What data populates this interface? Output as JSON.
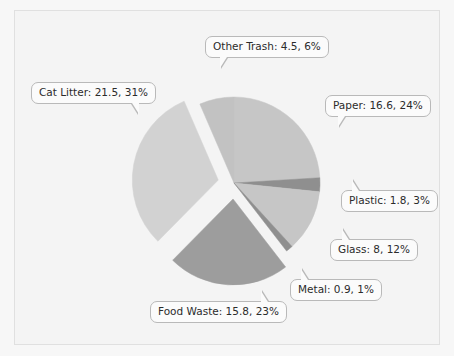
{
  "chart_data": {
    "type": "pie",
    "title": "",
    "subtitle": "",
    "xlabel": "",
    "ylabel": "",
    "legend_position": "none",
    "grid": false,
    "total": 69.1,
    "background_color": "#f4f4f4",
    "categories": [
      "Paper",
      "Plastic",
      "Glass",
      "Metal",
      "Food Waste",
      "Cat Litter",
      "Other Trash"
    ],
    "values": [
      16.6,
      1.8,
      8,
      0.9,
      15.8,
      21.5,
      4.5
    ],
    "percents": [
      24,
      3,
      12,
      1,
      23,
      31,
      6
    ],
    "slices": [
      {
        "name": "Paper",
        "value": 16.6,
        "percent": 24,
        "label": "Paper: 16.6, 24%",
        "color": "#c6c6c6",
        "start_angle": 0,
        "end_angle": 86.5,
        "exploded": false
      },
      {
        "name": "Plastic",
        "value": 1.8,
        "percent": 3,
        "label": "Plastic: 1.8, 3%",
        "color": "#8f8f8f",
        "start_angle": 86.5,
        "end_angle": 95.9,
        "exploded": false
      },
      {
        "name": "Glass",
        "value": 8,
        "percent": 12,
        "label": "Glass: 8, 12%",
        "color": "#c6c6c6",
        "start_angle": 95.9,
        "end_angle": 137.6,
        "exploded": false
      },
      {
        "name": "Metal",
        "value": 0.9,
        "percent": 1,
        "label": "Metal: 0.9, 1%",
        "color": "#8f8f8f",
        "start_angle": 137.6,
        "end_angle": 142.3,
        "exploded": false
      },
      {
        "name": "Food Waste",
        "value": 15.8,
        "percent": 23,
        "label": "Food Waste: 15.8, 23%",
        "color": "#9d9d9d",
        "start_angle": 142.3,
        "end_angle": 224.6,
        "exploded": true
      },
      {
        "name": "Cat Litter",
        "value": 21.5,
        "percent": 31,
        "label": "Cat Litter: 21.5, 31%",
        "color": "#d2d2d2",
        "start_angle": 224.6,
        "end_angle": 336.6,
        "exploded": true
      },
      {
        "name": "Other Trash",
        "value": 4.5,
        "percent": 6,
        "label": "Other Trash: 4.5, 6%",
        "color": "#c2c2c2",
        "start_angle": 336.6,
        "end_angle": 360,
        "exploded": false
      }
    ]
  },
  "callouts": {
    "other_trash": "Other Trash: 4.5, 6%",
    "cat_litter": "Cat Litter: 21.5, 31%",
    "paper": "Paper: 16.6, 24%",
    "plastic": "Plastic: 1.8, 3%",
    "glass": "Glass: 8, 12%",
    "metal": "Metal: 0.9, 1%",
    "food_waste": "Food Waste: 15.8, 23%"
  }
}
